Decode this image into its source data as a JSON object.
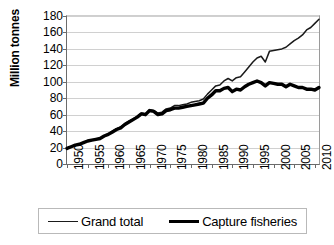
{
  "chart_data": {
    "type": "line",
    "title": "",
    "xlabel": "",
    "ylabel": "Million tonnes",
    "xlim": [
      1950,
      2011
    ],
    "ylim": [
      0,
      180
    ],
    "ytick_step": 20,
    "xtick_step": 5,
    "grid": "horizontal",
    "legend_position": "bottom",
    "ytick_labels": [
      "0",
      "20",
      "40",
      "60",
      "80",
      "100",
      "120",
      "140",
      "160",
      "180"
    ],
    "ytick_values": [
      0,
      20,
      40,
      60,
      80,
      100,
      120,
      140,
      160,
      180
    ],
    "xtick_labels": [
      "1950",
      "1955",
      "1960",
      "1965",
      "1970",
      "1975",
      "1980",
      "1985",
      "1990",
      "1995",
      "2000",
      "2005",
      "2010"
    ],
    "xtick_values": [
      1950,
      1955,
      1960,
      1965,
      1970,
      1975,
      1980,
      1985,
      1990,
      1995,
      2000,
      2005,
      2010
    ],
    "x": [
      1950,
      1951,
      1952,
      1953,
      1954,
      1955,
      1956,
      1957,
      1958,
      1959,
      1960,
      1961,
      1962,
      1963,
      1964,
      1965,
      1966,
      1967,
      1968,
      1969,
      1970,
      1971,
      1972,
      1973,
      1974,
      1975,
      1976,
      1977,
      1978,
      1979,
      1980,
      1981,
      1982,
      1983,
      1984,
      1985,
      1986,
      1987,
      1988,
      1989,
      1990,
      1991,
      1992,
      1993,
      1994,
      1995,
      1996,
      1997,
      1998,
      1999,
      2000,
      2001,
      2002,
      2003,
      2004,
      2005,
      2006,
      2007,
      2008,
      2009,
      2010,
      2011
    ],
    "series": [
      {
        "name": "Grand total",
        "style": "thin",
        "color": "#1a1a1a",
        "values": [
          19,
          21,
          23,
          24,
          26,
          28,
          29,
          30,
          31,
          34,
          37,
          40,
          43,
          45,
          49,
          52,
          55,
          58,
          62,
          61,
          66,
          65,
          62,
          63,
          67,
          68,
          71,
          71,
          72,
          73,
          75,
          76,
          77,
          79,
          85,
          90,
          95,
          96,
          101,
          104,
          101,
          105,
          106,
          112,
          118,
          124,
          129,
          131,
          124,
          137,
          138,
          139,
          140,
          142,
          146,
          150,
          153,
          157,
          163,
          166,
          171,
          176
        ]
      },
      {
        "name": "Capture fisheries",
        "style": "thick",
        "color": "#000000",
        "values": [
          19,
          21,
          23,
          24,
          26,
          28,
          29,
          30,
          31,
          34,
          36,
          39,
          42,
          44,
          48,
          51,
          54,
          57,
          61,
          60,
          65,
          64,
          60,
          61,
          65,
          66,
          68,
          68,
          69,
          70,
          71,
          72,
          73,
          74,
          80,
          84,
          89,
          89,
          92,
          93,
          88,
          91,
          90,
          94,
          97,
          99,
          101,
          99,
          95,
          99,
          98,
          97,
          97,
          94,
          97,
          95,
          93,
          93,
          91,
          91,
          90,
          93
        ]
      }
    ]
  },
  "legend": {
    "items": [
      {
        "label": "Grand total",
        "style": "thin"
      },
      {
        "label": "Capture fisheries",
        "style": "thick"
      }
    ]
  },
  "footer": {
    "partial_text": ""
  }
}
